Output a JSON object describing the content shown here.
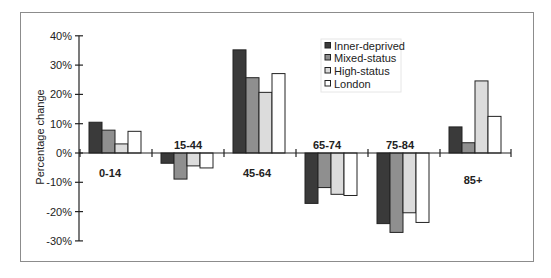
{
  "chart_data": {
    "type": "bar",
    "title": "",
    "xlabel": "",
    "ylabel": "Percentage change",
    "ylim": [
      -30,
      40
    ],
    "yticks": [
      "40%",
      "30%",
      "20%",
      "10%",
      "0%",
      "-10%",
      "-20%",
      "-30%"
    ],
    "ytick_values": [
      40,
      30,
      20,
      10,
      0,
      -10,
      -20,
      -30
    ],
    "grid": false,
    "legend_position": "upper right (inside, between 65-74 and 85+)",
    "categories": [
      "0-14",
      "15-44",
      "45-64",
      "65-74",
      "75-84",
      "85+"
    ],
    "series": [
      {
        "name": "Inner-deprived",
        "color": "#3a3a3a",
        "values": [
          10.5,
          -3.5,
          35.2,
          -17.2,
          -24.1,
          8.9
        ]
      },
      {
        "name": "Mixed-status",
        "color": "#8f8f8f",
        "values": [
          7.8,
          -8.9,
          25.7,
          -11.8,
          -27.1,
          3.5
        ]
      },
      {
        "name": "High-status",
        "color": "#dcdcdc",
        "values": [
          3.1,
          -4.4,
          20.7,
          -14.1,
          -20.4,
          24.6
        ]
      },
      {
        "name": "London",
        "color": "#ffffff",
        "values": [
          7.4,
          -5.1,
          27.1,
          -14.5,
          -23.7,
          12.5
        ]
      }
    ]
  }
}
